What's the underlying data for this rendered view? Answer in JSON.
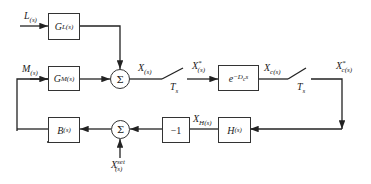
{
  "diagram": {
    "type": "block-diagram",
    "signals": {
      "L": {
        "main": "L",
        "sub": "(s)"
      },
      "M": {
        "main": "M",
        "sub": "(s)"
      },
      "X": {
        "main": "X",
        "sub": "(s)"
      },
      "X_star": {
        "main": "X",
        "sup": "*",
        "sub": "(s)"
      },
      "Xc": {
        "main": "X",
        "sub": "c(s)"
      },
      "Xc_star": {
        "main": "X",
        "sup": "*",
        "sub": "c(s)"
      },
      "XH": {
        "main": "X",
        "sub": "H(s)"
      },
      "Xset": {
        "main": "X",
        "sup": "set",
        "sub": "(s)"
      }
    },
    "blocks": {
      "GL": {
        "main": "G",
        "sub": "L(s)"
      },
      "GM": {
        "main": "G",
        "sub": "M(s)"
      },
      "delay": {
        "main": "e",
        "sup": "−D",
        "sup_sub": "c",
        "sup_tail": "s"
      },
      "H": {
        "main": "H",
        "sub": "(s)"
      },
      "neg": {
        "text": "−1"
      },
      "B": {
        "main": "B",
        "sub": "(s)"
      }
    },
    "sums": {
      "top": "Σ",
      "bottom": "Σ"
    },
    "samplers": {
      "s1": {
        "main": "T",
        "sub": "s"
      },
      "s2": {
        "main": "T",
        "sub": "s"
      }
    }
  }
}
